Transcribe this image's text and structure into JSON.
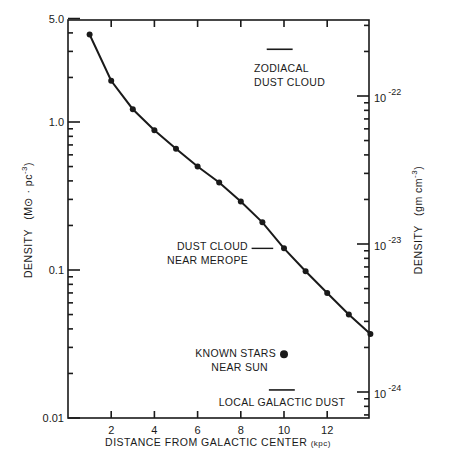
{
  "chart_data": {
    "type": "line",
    "title": "",
    "xlabel": "DISTANCE FROM GALACTIC CENTER",
    "xlabel_unit": "(kpc)",
    "ylabel_left": "DENSITY",
    "ylabel_left_unit": "(M⊙ · pc",
    "ylabel_left_unit_exp": "-3",
    "ylabel_right": "DENSITY",
    "ylabel_right_unit": "(gm  cm",
    "ylabel_right_unit_exp": "-3",
    "xlim": [
      0,
      14
    ],
    "ylim_left": [
      0.01,
      5.0
    ],
    "yscale": "log",
    "grid": false,
    "x_ticks": [
      2,
      4,
      6,
      8,
      10,
      12
    ],
    "x_tick_labels": [
      "2",
      "4",
      "6",
      "8",
      "10",
      "12"
    ],
    "y_left_ticks": [
      5.0,
      1.0,
      0.1,
      0.01
    ],
    "y_left_tick_labels": [
      "5.0",
      "1.0",
      "0.1",
      "0.01"
    ],
    "y_right_ticks_gcm3": [
      1e-22,
      1e-23,
      1e-24
    ],
    "y_right_tick_labels": [
      {
        "base": "10",
        "exp": "-22"
      },
      {
        "base": "10",
        "exp": "-23"
      },
      {
        "base": "10",
        "exp": "-24"
      }
    ],
    "right_axis_conversion_note": "1e-23 gm/cm3 corresponds to ~0.148 M⊙/pc3 on left axis",
    "series": [
      {
        "name": "Galactic density",
        "x": [
          1,
          2,
          3,
          4,
          5,
          6,
          7,
          8,
          9,
          10,
          11,
          12,
          13,
          14
        ],
        "values": [
          3.9,
          1.9,
          1.22,
          0.88,
          0.66,
          0.5,
          0.39,
          0.29,
          0.21,
          0.14,
          0.098,
          0.07,
          0.05,
          0.037
        ]
      }
    ],
    "annotations": [
      {
        "type": "bar",
        "lines": [
          "ZODIACAL",
          "DUST CLOUD"
        ],
        "x_range": [
          9.2,
          10.4
        ],
        "value": 3.1
      },
      {
        "type": "bar",
        "lines": [
          "DUST CLOUD",
          "NEAR MEROPE"
        ],
        "x_range": [
          8.5,
          9.5
        ],
        "value": 0.14
      },
      {
        "type": "point",
        "lines": [
          "KNOWN STARS",
          "NEAR SUN"
        ],
        "x": 10,
        "value": 0.027
      },
      {
        "type": "bar",
        "lines": [
          "LOCAL GALACTIC DUST"
        ],
        "x_range": [
          9.3,
          10.5
        ],
        "value": 0.015
      }
    ]
  }
}
